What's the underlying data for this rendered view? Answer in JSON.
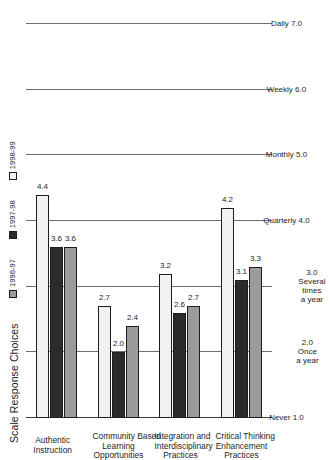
{
  "chart": {
    "title": "Scale Response Choices",
    "legend": [
      {
        "label": "1996-97",
        "color": "#9b9b9b",
        "swatch": "legend-swatch-1996-97"
      },
      {
        "label": "1997-98",
        "color": "#2b2b2b",
        "swatch": "legend-swatch-1997-98"
      },
      {
        "label": "1998-99",
        "color": "#f1f1f1",
        "swatch": "legend-swatch-1998-99"
      }
    ],
    "scale_labels": [
      {
        "text": "Daily 7.0",
        "value": 7.0
      },
      {
        "text": "Weekly 6.0",
        "value": 6.0
      },
      {
        "text": "Monthly 5.0",
        "value": 5.0
      },
      {
        "text": "Quarterly 4.0",
        "value": 4.0
      },
      {
        "text": "Several times a year 3.0",
        "value": 3.0
      },
      {
        "text": "Once a year 2.0",
        "value": 2.0
      },
      {
        "text": "Never 1.0",
        "value": 1.0
      }
    ],
    "labels": {
      "daily": "Daily  7.0",
      "weekly": "Weekly  6.0",
      "monthly": "Monthly  5.0",
      "quarterly": "Quarterly  4.0",
      "several": "Several<br>times<br>a year",
      "several_num": "3.0",
      "once": "Once<br>a year",
      "once_num": "2.0",
      "never": "Never  1.0"
    },
    "categories": [
      {
        "name": "Critical Thinking Enhancement Practices",
        "line1": "Critical Thinking",
        "line2": "Enhancement",
        "line3": "Practices"
      },
      {
        "name": "Integration and Interdisciplinary Practices",
        "line1": "Integration and",
        "line2": "Interdisciplinary",
        "line3": "Practices"
      },
      {
        "name": "Community Based Learning Opportunities",
        "line1": "Community Based",
        "line2": "Learning",
        "line3": "Opportunities"
      },
      {
        "name": "Authentic Instruction",
        "line1": "Authentic",
        "line2": "Instruction",
        "line3": ""
      }
    ],
    "values": {
      "critical": {
        "y1996": "3.3",
        "y1997": "3.1",
        "y1998": "4.2"
      },
      "integration": {
        "y1996": "2.7",
        "y1997": "2.6",
        "y1998": "3.2"
      },
      "community": {
        "y1996": "2.4",
        "y1997": "2.0",
        "y1998": "2.7"
      },
      "authentic": {
        "y1996": "3.6",
        "y1997": "3.6",
        "y1998": "4.4"
      }
    }
  },
  "chart_data": {
    "type": "bar",
    "orientation": "horizontal",
    "title": "Scale Response Choices",
    "xlabel": "",
    "ylabel": "",
    "categories": [
      "Critical Thinking Enhancement Practices",
      "Integration and Interdisciplinary Practices",
      "Community Based Learning Opportunities",
      "Authentic Instruction"
    ],
    "series": [
      {
        "name": "1996-97",
        "color": "#9b9b9b",
        "values": [
          3.3,
          2.7,
          2.4,
          3.6
        ]
      },
      {
        "name": "1997-98",
        "color": "#2b2b2b",
        "values": [
          3.1,
          2.6,
          2.0,
          3.6
        ]
      },
      {
        "name": "1998-99",
        "color": "#f1f1f1",
        "values": [
          4.2,
          3.2,
          2.7,
          4.4
        ]
      }
    ],
    "value_axis": {
      "min": 1.0,
      "max": 7.0,
      "ticks": [
        1.0,
        2.0,
        3.0,
        4.0,
        5.0,
        6.0,
        7.0
      ],
      "tick_labels": [
        "Never  1.0",
        "Once a year  2.0",
        "Several times a year  3.0",
        "Quarterly  4.0",
        "Monthly  5.0",
        "Weekly  6.0",
        "Daily  7.0"
      ]
    },
    "grid": true,
    "legend_position": "top-right",
    "data_labels": true
  }
}
